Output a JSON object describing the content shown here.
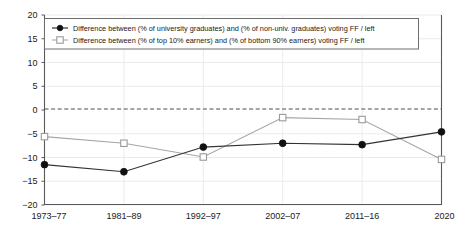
{
  "chart_data": {
    "type": "line",
    "title": "",
    "subtitle": "",
    "xlabel": "",
    "ylabel": "",
    "categories": [
      "1973–77",
      "1981–89",
      "1992–97",
      "2002–07",
      "2011–16",
      "2020"
    ],
    "ylim": [
      -20,
      20
    ],
    "yticks": [
      20,
      15,
      10,
      5,
      0,
      -5,
      -10,
      -15,
      -20
    ],
    "ytick_labels": [
      "20",
      "15",
      "10",
      "5",
      "0",
      "−5",
      "−10",
      "−15",
      "−20"
    ],
    "grid": true,
    "zero_reference_line": 0,
    "legend_position": "top-left",
    "series": [
      {
        "name": "Difference between (% of university graduates) and (% of non-univ. graduates) voting FF / left",
        "marker": "filled-circle",
        "color": "#111111",
        "values": [
          -11.5,
          -13.0,
          -7.8,
          -7.0,
          -7.3,
          -4.6
        ]
      },
      {
        "name": "Difference between (% of top 10% earners) and (% of bottom 90% earners) voting FF / left",
        "marker": "open-square",
        "color": "#9a9a9a",
        "values": [
          -5.6,
          -7.0,
          -9.9,
          -1.6,
          -2.0,
          -10.4
        ]
      }
    ]
  },
  "legend": {
    "entries": [
      {
        "label": "Difference between (% of university graduates) and (% of non-univ. graduates) voting FF / left",
        "marker": "filled-circle"
      },
      {
        "label": "Difference between (% of top 10% earners) and (% of bottom 90% earners) voting FF / left",
        "marker": "open-square"
      }
    ]
  },
  "colors": {
    "series_a": "#111111",
    "series_b": "#9a9a9a",
    "axis": "#595959",
    "grid": "#e6e6e6",
    "zero_line": "#4d4d4d",
    "background": "#ffffff"
  }
}
